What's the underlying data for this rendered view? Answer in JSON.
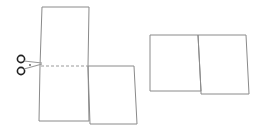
{
  "diagram": {
    "stroke_color": "#8a8a8a",
    "dash_color": "#9a9a9a",
    "scissors_color": "#222222",
    "left_figure": {
      "label": "",
      "cut_line": "dashed"
    },
    "right_figure": {
      "label": ""
    }
  }
}
